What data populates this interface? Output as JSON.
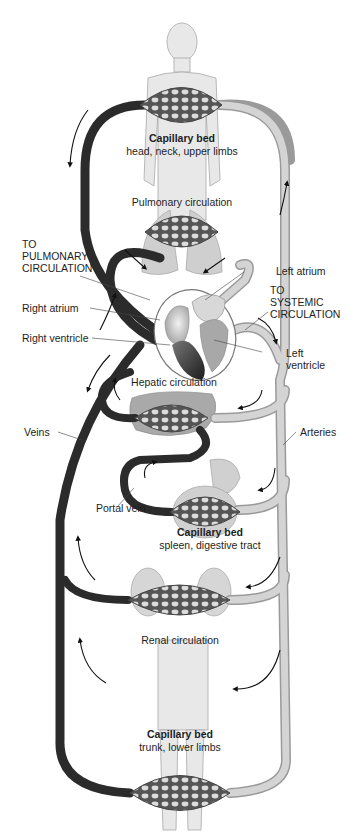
{
  "colors": {
    "vein": "#2b2b2b",
    "artery": "#d2d2d2",
    "artery_edge": "#9a9a9a",
    "body": "#e6e6e6",
    "body_edge": "#a8a8a8",
    "organ": "#b9b9b9",
    "capillary": "#555555"
  },
  "labels": {
    "cap_head_title": "Capillary bed",
    "cap_head_sub": "head, neck, upper limbs",
    "pulmonary": "Pulmonary circulation",
    "to_pulmonary": [
      "TO",
      "PULMONARY",
      "CIRCULATION"
    ],
    "left_atrium": "Left atrium",
    "to_systemic": [
      "TO",
      "SYSTEMIC",
      "CIRCULATION"
    ],
    "right_atrium": "Right atrium",
    "right_ventricle": "Right ventricle",
    "left_ventricle": [
      "Left",
      "ventricle"
    ],
    "hepatic": "Hepatic circulation",
    "veins": "Veins",
    "arteries": "Arteries",
    "portal_vein": "Portal vein",
    "cap_gut_title": "Capillary bed",
    "cap_gut_sub": "spleen, digestive tract",
    "renal": "Renal circulation",
    "cap_trunk_title": "Capillary bed",
    "cap_trunk_sub": "trunk, lower limbs"
  }
}
